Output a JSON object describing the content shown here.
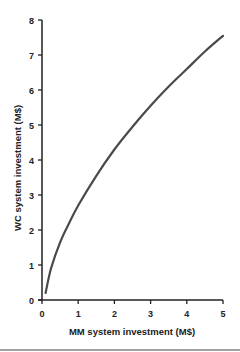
{
  "chart_data": {
    "type": "line",
    "title": "",
    "xlabel": "MM  system investment (M$)",
    "ylabel": "WC  system investment (M$)",
    "xlim": [
      0,
      5
    ],
    "ylim": [
      0,
      8
    ],
    "xticks": [
      0,
      1,
      2,
      3,
      4,
      5
    ],
    "yticks": [
      0,
      1,
      2,
      3,
      4,
      5,
      6,
      7,
      8
    ],
    "grid": false,
    "legend": null,
    "series": [
      {
        "name": "WC vs MM investment",
        "color": "#4a4a4a",
        "x": [
          0.1,
          0.25,
          0.5,
          0.75,
          1.0,
          1.5,
          2.0,
          2.5,
          3.0,
          3.5,
          4.0,
          4.5,
          5.0
        ],
        "y": [
          0.2,
          0.9,
          1.65,
          2.2,
          2.7,
          3.55,
          4.3,
          4.95,
          5.55,
          6.1,
          6.6,
          7.1,
          7.55
        ]
      }
    ]
  }
}
